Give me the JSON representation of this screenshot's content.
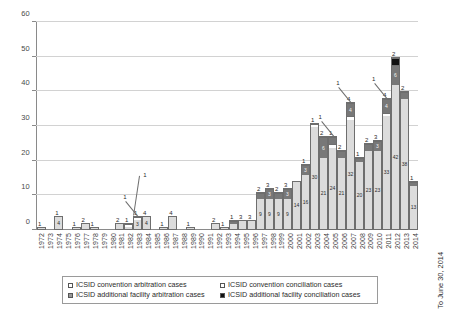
{
  "chart_data": {
    "type": "bar",
    "stacked": true,
    "title": "",
    "subtitle": "",
    "xlabel": "",
    "ylabel": "",
    "ylim": [
      0,
      60
    ],
    "yticks": [
      0,
      10,
      20,
      30,
      40,
      50,
      60
    ],
    "grid": true,
    "legend_position": "bottom",
    "note_right": "To June 30, 2014",
    "series": [
      {
        "name": "ICSID convention arbitration cases",
        "key": "conv-arb"
      },
      {
        "name": "ICSID convention conciliation cases",
        "key": "conv-con"
      },
      {
        "name": "ICSID additional facility arbitration cases",
        "key": "af-arb"
      },
      {
        "name": "ICSID additional facility conciliation cases",
        "key": "af-con"
      }
    ],
    "categories": [
      "1972",
      "1973",
      "1974",
      "1975",
      "1976",
      "1977",
      "1978",
      "1979",
      "1980",
      "1981",
      "1982",
      "1983",
      "1984",
      "1985",
      "1986",
      "1987",
      "1988",
      "1989",
      "1990",
      "1991",
      "1992",
      "1993",
      "1994",
      "1995",
      "1996",
      "1997",
      "1998",
      "1999",
      "2000",
      "2001",
      "2002",
      "2003",
      "2004",
      "2005",
      "2006",
      "2007",
      "2008",
      "2009",
      "2010",
      "2011",
      "2012",
      "2013",
      "2014"
    ],
    "bars": [
      {
        "year": "1972",
        "total": 1,
        "segments": [
          {
            "key": "conv-arb",
            "value": 1,
            "label": ""
          }
        ]
      },
      {
        "year": "1973",
        "total": 0,
        "segments": []
      },
      {
        "year": "1974",
        "total": 4,
        "segments": [
          {
            "key": "conv-arb",
            "value": 4,
            "label": "4"
          }
        ]
      },
      {
        "year": "1975",
        "total": 0,
        "segments": []
      },
      {
        "year": "1976",
        "total": 1,
        "segments": [
          {
            "key": "conv-arb",
            "value": 1,
            "label": ""
          }
        ]
      },
      {
        "year": "1977",
        "total": 2,
        "segments": [
          {
            "key": "conv-arb",
            "value": 2,
            "label": ""
          }
        ]
      },
      {
        "year": "1978",
        "total": 1,
        "segments": [
          {
            "key": "conv-arb",
            "value": 1,
            "label": ""
          }
        ]
      },
      {
        "year": "1979",
        "total": 0,
        "segments": []
      },
      {
        "year": "1980",
        "total": 0,
        "segments": []
      },
      {
        "year": "1981",
        "total": 2,
        "segments": [
          {
            "key": "conv-arb",
            "value": 2,
            "label": ""
          }
        ]
      },
      {
        "year": "1982",
        "total": 2,
        "segments": [
          {
            "key": "conv-arb",
            "value": 1,
            "label": ""
          },
          {
            "key": "conv-con",
            "value": 1,
            "label": ""
          }
        ]
      },
      {
        "year": "1983",
        "total": 4,
        "segments": [
          {
            "key": "conv-arb",
            "value": 3,
            "label": "3"
          },
          {
            "key": "conv-con",
            "value": 1,
            "label": ""
          }
        ]
      },
      {
        "year": "1984",
        "total": 4,
        "segments": [
          {
            "key": "conv-arb",
            "value": 4,
            "label": "4"
          }
        ]
      },
      {
        "year": "1985",
        "total": 0,
        "segments": []
      },
      {
        "year": "1986",
        "total": 1,
        "segments": [
          {
            "key": "conv-arb",
            "value": 1,
            "label": ""
          }
        ]
      },
      {
        "year": "1987",
        "total": 4,
        "segments": [
          {
            "key": "conv-arb",
            "value": 4,
            "label": ""
          }
        ]
      },
      {
        "year": "1988",
        "total": 0,
        "segments": []
      },
      {
        "year": "1989",
        "total": 1,
        "segments": [
          {
            "key": "conv-arb",
            "value": 1,
            "label": ""
          }
        ]
      },
      {
        "year": "1990",
        "total": 0,
        "segments": []
      },
      {
        "year": "1991",
        "total": 0,
        "segments": []
      },
      {
        "year": "1992",
        "total": 2,
        "segments": [
          {
            "key": "conv-arb",
            "value": 2,
            "label": ""
          }
        ]
      },
      {
        "year": "1993",
        "total": 1,
        "segments": [
          {
            "key": "conv-arb",
            "value": 1,
            "label": ""
          }
        ]
      },
      {
        "year": "1994",
        "total": 3,
        "segments": [
          {
            "key": "conv-arb",
            "value": 2,
            "label": "2"
          },
          {
            "key": "af-arb",
            "value": 1,
            "label": ""
          }
        ]
      },
      {
        "year": "1995",
        "total": 3,
        "segments": [
          {
            "key": "conv-arb",
            "value": 3,
            "label": ""
          }
        ]
      },
      {
        "year": "1996",
        "total": 3,
        "segments": [
          {
            "key": "conv-arb",
            "value": 3,
            "label": ""
          }
        ]
      },
      {
        "year": "1997",
        "total": 11,
        "segments": [
          {
            "key": "conv-arb",
            "value": 9,
            "label": "9"
          },
          {
            "key": "af-arb",
            "value": 2,
            "label": "2"
          }
        ]
      },
      {
        "year": "1998",
        "total": 12,
        "segments": [
          {
            "key": "conv-arb",
            "value": 9,
            "label": "9"
          },
          {
            "key": "af-arb",
            "value": 3,
            "label": "3"
          }
        ]
      },
      {
        "year": "1999",
        "total": 11,
        "segments": [
          {
            "key": "conv-arb",
            "value": 9,
            "label": "9"
          },
          {
            "key": "af-arb",
            "value": 2,
            "label": "2"
          }
        ]
      },
      {
        "year": "2000",
        "total": 12,
        "segments": [
          {
            "key": "conv-arb",
            "value": 9,
            "label": "9"
          },
          {
            "key": "af-arb",
            "value": 3,
            "label": "3"
          }
        ]
      },
      {
        "year": "2001",
        "total": 14,
        "segments": [
          {
            "key": "conv-arb",
            "value": 14,
            "label": "14"
          }
        ]
      },
      {
        "year": "2002",
        "total": 19,
        "segments": [
          {
            "key": "conv-arb",
            "value": 16,
            "label": "16"
          },
          {
            "key": "af-arb",
            "value": 3,
            "label": "3"
          }
        ]
      },
      {
        "year": "2003",
        "total": 31,
        "segments": [
          {
            "key": "conv-arb",
            "value": 30,
            "label": "30"
          },
          {
            "key": "conv-con",
            "value": 1,
            "label": ""
          }
        ]
      },
      {
        "year": "2004",
        "total": 27,
        "segments": [
          {
            "key": "conv-arb",
            "value": 21,
            "label": "21"
          },
          {
            "key": "af-arb",
            "value": 6,
            "label": "6"
          }
        ]
      },
      {
        "year": "2005",
        "total": 27,
        "segments": [
          {
            "key": "conv-arb",
            "value": 24,
            "label": "24"
          },
          {
            "key": "conv-con",
            "value": 1,
            "label": ""
          },
          {
            "key": "af-arb",
            "value": 2,
            "label": "2"
          }
        ]
      },
      {
        "year": "2006",
        "total": 23,
        "segments": [
          {
            "key": "conv-arb",
            "value": 21,
            "label": "21"
          },
          {
            "key": "af-arb",
            "value": 2,
            "label": "2"
          }
        ]
      },
      {
        "year": "2007",
        "total": 37,
        "segments": [
          {
            "key": "conv-arb",
            "value": 32,
            "label": "32"
          },
          {
            "key": "conv-con",
            "value": 1,
            "label": ""
          },
          {
            "key": "af-arb",
            "value": 4,
            "label": "4"
          }
        ]
      },
      {
        "year": "2008",
        "total": 21,
        "segments": [
          {
            "key": "conv-arb",
            "value": 20,
            "label": "20"
          },
          {
            "key": "af-arb",
            "value": 1,
            "label": "1"
          }
        ]
      },
      {
        "year": "2009",
        "total": 25,
        "segments": [
          {
            "key": "conv-arb",
            "value": 23,
            "label": "23"
          },
          {
            "key": "af-arb",
            "value": 2,
            "label": "2"
          }
        ]
      },
      {
        "year": "2010",
        "total": 26,
        "segments": [
          {
            "key": "conv-arb",
            "value": 23,
            "label": "23"
          },
          {
            "key": "af-arb",
            "value": 3,
            "label": "3"
          }
        ]
      },
      {
        "year": "2011",
        "total": 38,
        "segments": [
          {
            "key": "conv-arb",
            "value": 33,
            "label": "33"
          },
          {
            "key": "conv-con",
            "value": 1,
            "label": ""
          },
          {
            "key": "af-arb",
            "value": 4,
            "label": "4"
          }
        ]
      },
      {
        "year": "2012",
        "total": 50,
        "segments": [
          {
            "key": "conv-arb",
            "value": 42,
            "label": "42"
          },
          {
            "key": "af-arb",
            "value": 6,
            "label": "6"
          },
          {
            "key": "af-con",
            "value": 2,
            "label": "2"
          }
        ]
      },
      {
        "year": "2013",
        "total": 40,
        "segments": [
          {
            "key": "conv-arb",
            "value": 38,
            "label": "38"
          },
          {
            "key": "af-arb",
            "value": 2,
            "label": "2"
          }
        ]
      },
      {
        "year": "2014",
        "total": 14,
        "segments": [
          {
            "key": "conv-arb",
            "value": 13,
            "label": "13"
          },
          {
            "key": "af-arb",
            "value": 1,
            "label": "1"
          }
        ]
      }
    ],
    "top_labels": {
      "1972": "1",
      "1974": "1",
      "1976": "1",
      "1977": "2",
      "1978": "1",
      "1981": "2",
      "1982": "1",
      "1983": "1",
      "1984": "4",
      "1986": "1",
      "1987": "4",
      "1989": "1",
      "1992": "2",
      "1993": "1",
      "1994": "1",
      "1995": "3",
      "1996": "3",
      "1997": "2",
      "1998": "3",
      "1999": "2",
      "2000": "3",
      "2002": "1",
      "2003": "1",
      "2004": "2",
      "2005": "1",
      "2006": "2",
      "2007": "4",
      "2008": "1",
      "2009": "2",
      "2010": "3",
      "2011": "4",
      "2012": "2",
      "2013": "2",
      "2014": "1"
    },
    "callouts": [
      {
        "year": "1983",
        "text": "1"
      },
      {
        "year": "2005",
        "text": "1"
      },
      {
        "year": "2007",
        "text": "1"
      },
      {
        "year": "2011",
        "text": "1"
      }
    ]
  },
  "legend": {
    "items": [
      {
        "label": "ICSID convention arbitration cases",
        "swatch": "sw-conv-arb"
      },
      {
        "label": "ICSID convention conciliation cases",
        "swatch": "sw-conv-con"
      },
      {
        "label": "ICSID additional facility arbitration cases",
        "swatch": "sw-af-arb"
      },
      {
        "label": "ICSID additional facility conciliation cases",
        "swatch": "sw-af-con"
      }
    ]
  },
  "axis": {
    "y_labels": [
      "60",
      "50",
      "40",
      "30",
      "20",
      "10",
      "0"
    ]
  },
  "note": {
    "right": "To June 30, 2014"
  },
  "colors": {
    "conv_arb": "#dcdcdc",
    "conv_con": "#ffffff",
    "af_arb": "#787878",
    "af_con": "#111111",
    "grid": "#d2d2d2",
    "axis": "#8a8a8a",
    "text": "#3b3b3b"
  }
}
